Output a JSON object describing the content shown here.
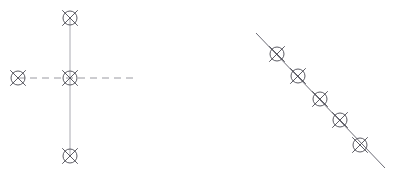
{
  "canvas": {
    "width": 394,
    "height": 179,
    "background_color": "#ffffff",
    "title": "Crossed-circle marker diagrams"
  },
  "style": {
    "marker_stroke_color": "#4a4a52",
    "marker_fill_color": "none",
    "marker_radius": 7,
    "marker_tick_overshoot": 4,
    "marker_stroke_width": 0.9,
    "dashed_line_color": "#8e8e96",
    "dashed_line_width": 0.9,
    "dash_pattern": "7 5",
    "dotted_line_color": "#a0a0a8",
    "solid_line_color": "#6b6b75",
    "solid_line_width": 1.0
  },
  "figures": [
    {
      "id": "figure-left",
      "name": "cross-configuration",
      "label": "Cross configuration with four crossed-circle markers",
      "line_style": "dashed",
      "segments": [
        {
          "name": "vertical-axis-line",
          "style": "dashed-fine",
          "x1": 70,
          "y1": 18,
          "x2": 70,
          "y2": 156
        },
        {
          "name": "horizontal-axis-line",
          "style": "dashed",
          "x1": 18,
          "y1": 78,
          "x2": 136,
          "y2": 78
        }
      ],
      "markers": [
        {
          "name": "marker-top",
          "x": 70,
          "y": 18
        },
        {
          "name": "marker-center",
          "x": 70,
          "y": 78
        },
        {
          "name": "marker-left",
          "x": 18,
          "y": 78
        },
        {
          "name": "marker-bottom",
          "x": 70,
          "y": 156
        }
      ]
    },
    {
      "id": "figure-right",
      "name": "diagonal-configuration",
      "label": "Diagonal line with five crossed-circle markers",
      "line_style": "solid",
      "segments": [
        {
          "name": "diagonal-axis-line",
          "style": "solid",
          "x1": 256,
          "y1": 33,
          "x2": 385,
          "y2": 168
        }
      ],
      "markers": [
        {
          "name": "marker-1",
          "x": 277,
          "y": 54
        },
        {
          "name": "marker-2",
          "x": 298,
          "y": 76
        },
        {
          "name": "marker-3",
          "x": 320,
          "y": 99
        },
        {
          "name": "marker-4",
          "x": 340,
          "y": 120
        },
        {
          "name": "marker-5",
          "x": 360,
          "y": 145
        }
      ]
    }
  ],
  "icons": {
    "marker": "crossed-circle-icon"
  }
}
